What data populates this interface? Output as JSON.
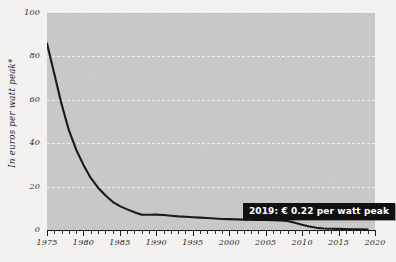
{
  "chart_data": {
    "type": "line",
    "title": "",
    "xlabel": "",
    "ylabel": "In euros per watt peak*",
    "xlim": [
      1975,
      2020
    ],
    "ylim": [
      0,
      100
    ],
    "grid": true,
    "legend": false,
    "y_ticks": [
      0,
      20,
      40,
      60,
      80,
      100
    ],
    "y_tick_labels": [
      "0",
      "20",
      "40",
      "60",
      "80",
      "100"
    ],
    "x_ticks": [
      1975,
      1980,
      1985,
      1990,
      1995,
      2000,
      2005,
      2010,
      2015,
      2020
    ],
    "x_tick_labels": [
      "1975",
      "1980",
      "1985",
      "1990",
      "1995",
      "2000",
      "2005",
      "2010",
      "2015",
      "2020"
    ],
    "x_minor_tick_interval": 1,
    "series": [
      {
        "name": "Solar module price",
        "color": "#1a1a1a",
        "x": [
          1975,
          1976,
          1977,
          1978,
          1979,
          1980,
          1981,
          1982,
          1983,
          1984,
          1985,
          1986,
          1987,
          1988,
          1989,
          1990,
          1991,
          1992,
          1993,
          1994,
          1995,
          1996,
          1997,
          1998,
          1999,
          2000,
          2001,
          2002,
          2003,
          2004,
          2005,
          2006,
          2007,
          2008,
          2009,
          2010,
          2011,
          2012,
          2013,
          2014,
          2015,
          2016,
          2017,
          2018,
          2019
        ],
        "values": [
          86,
          72,
          58,
          46,
          37,
          30,
          24,
          19.5,
          16,
          13,
          11,
          9.5,
          8.2,
          7.0,
          7.0,
          7.1,
          6.9,
          6.6,
          6.3,
          6.1,
          5.9,
          5.7,
          5.5,
          5.3,
          5.1,
          5.0,
          4.9,
          4.8,
          4.7,
          4.6,
          4.6,
          4.5,
          4.4,
          4.2,
          3.3,
          2.4,
          1.6,
          1.0,
          0.72,
          0.6,
          0.52,
          0.42,
          0.33,
          0.27,
          0.22
        ]
      }
    ],
    "annotations": [
      {
        "name": "price-callout",
        "text": "2019: € 0.22 per watt peak",
        "year": 2019,
        "value": 0.22
      }
    ],
    "footnote_marker": "*"
  },
  "axis": {
    "y_label": "In euros per watt peak*"
  },
  "colors": {
    "panel": "#c9c8c6",
    "page": "#f3f2f0",
    "line": "#1a1a1a",
    "callout_bg": "#111111",
    "callout_text": "#ffffff",
    "gridline": "#ffffff"
  }
}
